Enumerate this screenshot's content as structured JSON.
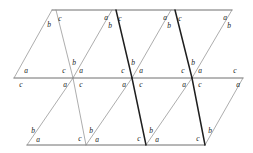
{
  "figure": {
    "name": "triangle-tessellation",
    "canvas": {
      "width": 253,
      "height": 153
    },
    "colors": {
      "background": "#ffffff",
      "line_light": "#8a8a8a",
      "line_medium": "#6e6e6e",
      "line_bold": "#1f1f1f",
      "label": "#1a1a1a"
    },
    "angle_labels": [
      "a",
      "b",
      "c"
    ],
    "horizontal_lines": [
      {
        "name": "top-edge",
        "x1": 52,
        "y1": 10,
        "x2": 232,
        "y2": 10,
        "weight": "medium"
      },
      {
        "name": "middle-edge",
        "x1": 14,
        "y1": 78,
        "x2": 243,
        "y2": 78,
        "weight": "medium"
      },
      {
        "name": "bottom-edge",
        "x1": 27,
        "y1": 145,
        "x2": 205,
        "y2": 145,
        "weight": "medium"
      }
    ],
    "diagonals_up": [
      {
        "name": "upper-rise-1",
        "x1": 14,
        "y1": 78,
        "x2": 52,
        "y2": 10,
        "weight": "light"
      },
      {
        "name": "upper-rise-2",
        "x1": 73,
        "y1": 78,
        "x2": 112,
        "y2": 10,
        "weight": "light"
      },
      {
        "name": "upper-rise-3",
        "x1": 132,
        "y1": 78,
        "x2": 171,
        "y2": 10,
        "weight": "light"
      },
      {
        "name": "upper-rise-4",
        "x1": 192,
        "y1": 78,
        "x2": 232,
        "y2": 10,
        "weight": "light"
      },
      {
        "name": "lower-rise-1",
        "x1": 27,
        "y1": 145,
        "x2": 73,
        "y2": 78,
        "weight": "light"
      },
      {
        "name": "lower-rise-2",
        "x1": 86,
        "y1": 145,
        "x2": 132,
        "y2": 78,
        "weight": "light"
      },
      {
        "name": "lower-rise-3",
        "x1": 146,
        "y1": 145,
        "x2": 192,
        "y2": 78,
        "weight": "light"
      },
      {
        "name": "lower-rise-4",
        "x1": 205,
        "y1": 145,
        "x2": 243,
        "y2": 78,
        "weight": "light"
      }
    ],
    "diagonals_down": [
      {
        "name": "upper-fall-1",
        "x1": 56,
        "y1": 10,
        "x2": 73,
        "y2": 78,
        "weight": "light"
      },
      {
        "name": "upper-fall-2",
        "x1": 116,
        "y1": 10,
        "x2": 132,
        "y2": 78,
        "weight": "bold"
      },
      {
        "name": "upper-fall-3",
        "x1": 175,
        "y1": 10,
        "x2": 192,
        "y2": 78,
        "weight": "bold"
      },
      {
        "name": "lower-fall-1",
        "x1": 73,
        "y1": 78,
        "x2": 86,
        "y2": 145,
        "weight": "light"
      },
      {
        "name": "lower-fall-2",
        "x1": 132,
        "y1": 78,
        "x2": 146,
        "y2": 145,
        "weight": "bold"
      },
      {
        "name": "lower-fall-3",
        "x1": 192,
        "y1": 78,
        "x2": 205,
        "y2": 145,
        "weight": "bold"
      }
    ],
    "labels": [
      {
        "id": "t0",
        "text": "c",
        "x": 60,
        "y": 19
      },
      {
        "id": "t1",
        "text": "b",
        "x": 49,
        "y": 25
      },
      {
        "id": "t2",
        "text": "a",
        "x": 106,
        "y": 18
      },
      {
        "id": "t3",
        "text": "c",
        "x": 120,
        "y": 19
      },
      {
        "id": "t4",
        "text": "b",
        "x": 110,
        "y": 26
      },
      {
        "id": "t5",
        "text": "a",
        "x": 165,
        "y": 18
      },
      {
        "id": "t6",
        "text": "c",
        "x": 180,
        "y": 19
      },
      {
        "id": "t7",
        "text": "b",
        "x": 169,
        "y": 26
      },
      {
        "id": "t8",
        "text": "a",
        "x": 225,
        "y": 18
      },
      {
        "id": "t9",
        "text": "b",
        "x": 229,
        "y": 26
      },
      {
        "id": "m0",
        "text": "a",
        "x": 26,
        "y": 71
      },
      {
        "id": "m1",
        "text": "c",
        "x": 21,
        "y": 85
      },
      {
        "id": "m2",
        "text": "c",
        "x": 64,
        "y": 71
      },
      {
        "id": "m3",
        "text": "b",
        "x": 74,
        "y": 63
      },
      {
        "id": "m4",
        "text": "a",
        "x": 81,
        "y": 71
      },
      {
        "id": "m5",
        "text": "a",
        "x": 65,
        "y": 85
      },
      {
        "id": "m6",
        "text": "c",
        "x": 81,
        "y": 85
      },
      {
        "id": "m7",
        "text": "c",
        "x": 123,
        "y": 71
      },
      {
        "id": "m8",
        "text": "b",
        "x": 133,
        "y": 63
      },
      {
        "id": "m9",
        "text": "a",
        "x": 141,
        "y": 71
      },
      {
        "id": "m10",
        "text": "a",
        "x": 124,
        "y": 85
      },
      {
        "id": "m11",
        "text": "c",
        "x": 141,
        "y": 85
      },
      {
        "id": "m12",
        "text": "c",
        "x": 183,
        "y": 71
      },
      {
        "id": "m13",
        "text": "b",
        "x": 193,
        "y": 63
      },
      {
        "id": "m14",
        "text": "a",
        "x": 200,
        "y": 71
      },
      {
        "id": "m15",
        "text": "a",
        "x": 184,
        "y": 85
      },
      {
        "id": "m16",
        "text": "c",
        "x": 200,
        "y": 85
      },
      {
        "id": "m17",
        "text": "c",
        "x": 235,
        "y": 71
      },
      {
        "id": "m18",
        "text": "a",
        "x": 238,
        "y": 85
      },
      {
        "id": "b0",
        "text": "b",
        "x": 33,
        "y": 131
      },
      {
        "id": "b1",
        "text": "a",
        "x": 38,
        "y": 140
      },
      {
        "id": "b2",
        "text": "c",
        "x": 80,
        "y": 139
      },
      {
        "id": "b3",
        "text": "b",
        "x": 91,
        "y": 131
      },
      {
        "id": "b4",
        "text": "a",
        "x": 97,
        "y": 140
      },
      {
        "id": "b5",
        "text": "c",
        "x": 139,
        "y": 139
      },
      {
        "id": "b6",
        "text": "b",
        "x": 151,
        "y": 131
      },
      {
        "id": "b7",
        "text": "a",
        "x": 157,
        "y": 140
      },
      {
        "id": "b8",
        "text": "c",
        "x": 198,
        "y": 139
      },
      {
        "id": "b9",
        "text": "b",
        "x": 210,
        "y": 131
      }
    ]
  }
}
